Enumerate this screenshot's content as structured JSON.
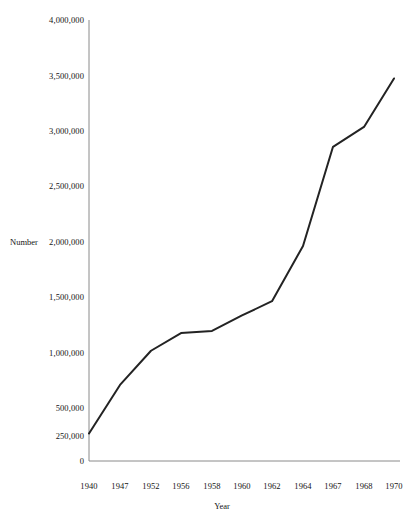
{
  "chart_data": {
    "type": "line",
    "title": "",
    "xlabel": "Year",
    "ylabel": "Number",
    "x": [
      1940,
      1947,
      1952,
      1956,
      1958,
      1960,
      1962,
      1964,
      1967,
      1968,
      1970
    ],
    "categories": [
      "1940",
      "1947",
      "1952",
      "1956",
      "1958",
      "1960",
      "1962",
      "1964",
      "1967",
      "1968",
      "1970"
    ],
    "values": [
      250000,
      690000,
      1000000,
      1160000,
      1180000,
      1320000,
      1450000,
      1950000,
      2850000,
      3030000,
      3470000
    ],
    "series": [
      {
        "name": "Number",
        "values": [
          250000,
          690000,
          1000000,
          1160000,
          1180000,
          1320000,
          1450000,
          1950000,
          2850000,
          3030000,
          3470000
        ]
      }
    ],
    "ylim": [
      0,
      4000000
    ],
    "ytick_values": [
      0,
      250000,
      500000,
      1000000,
      1500000,
      2000000,
      2500000,
      3000000,
      3500000,
      4000000
    ],
    "ytick_labels": [
      "0",
      "250,000",
      "500,000",
      "1,000,000",
      "1,500,000",
      "2,000,000",
      "2,500,000",
      "3,000,000",
      "3,500,000",
      "4,000,000"
    ],
    "xtick_labels": [
      "1940",
      "1947",
      "1952",
      "1956",
      "1958",
      "1960",
      "1962",
      "1964",
      "1967",
      "1968",
      "1970"
    ],
    "grid": false,
    "legend": false,
    "legend_position": "none",
    "line_color": "#232323",
    "axis_color": "#8a8a8a",
    "background_color": "#ffffff"
  },
  "axis_labels": {
    "y_title": "Number",
    "x_title": "Year"
  }
}
